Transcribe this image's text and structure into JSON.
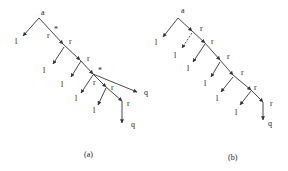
{
  "figure": {
    "panels": [
      {
        "id": "a",
        "caption": "(a)",
        "root_label": "a",
        "edge_labels": [
          "*",
          "r",
          "r",
          "r",
          "*",
          "r",
          "r",
          "r"
        ],
        "leaf_labels": [
          "l",
          "l",
          "l",
          "l",
          "l",
          "l"
        ],
        "terminal_labels": [
          "q",
          "q"
        ]
      },
      {
        "id": "b",
        "caption": "(b)",
        "root_label": "a",
        "edge_labels": [
          "r",
          "r",
          "r",
          "r",
          "r",
          "r"
        ],
        "leaf_labels": [
          "l",
          "l",
          "l",
          "l",
          "l",
          "l",
          "l"
        ],
        "terminal_labels": [
          "q"
        ],
        "dashed_branch": "l"
      }
    ]
  },
  "labels": {
    "a_root": "a",
    "a_star1": "*",
    "a_r1": "r",
    "a_r2": "r",
    "a_r3": "r",
    "a_star2": "*",
    "a_r4": "r",
    "a_r5": "r",
    "a_r6": "r",
    "a_l1": "l",
    "a_l2": "l",
    "a_l3": "l",
    "a_l4": "l",
    "a_l5": "l",
    "a_q1": "q",
    "a_q2": "q",
    "a_caption": "(a)",
    "b_root": "a",
    "b_r1": "r",
    "b_r2": "r",
    "b_r3": "r",
    "b_r4": "r",
    "b_r5": "r",
    "b_r6": "r",
    "b_l1": "l",
    "b_l2": "l",
    "b_l3": "l",
    "b_l4": "l",
    "b_l5": "l",
    "b_l6": "l",
    "b_l7": "l",
    "b_q1": "q",
    "b_caption": "(b)"
  }
}
